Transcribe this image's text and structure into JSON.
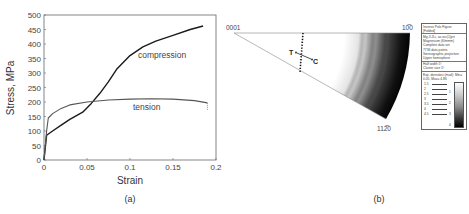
{
  "panels": {
    "a": {
      "label": "(a)"
    },
    "b": {
      "label": "(b)"
    }
  },
  "chart_data": [
    {
      "type": "line",
      "panel": "(a)",
      "title": "",
      "xlabel": "Strain",
      "ylabel": "Stress, MPa",
      "xlim": [
        0,
        0.2
      ],
      "ylim": [
        0,
        500
      ],
      "x_ticks": [
        "0",
        "0.05",
        "0.1",
        "0.15",
        "0.2"
      ],
      "y_ticks": [
        "0",
        "50",
        "100",
        "150",
        "200",
        "250",
        "300",
        "350",
        "400",
        "450",
        "500"
      ],
      "grid": false,
      "legend": "inline annotations",
      "series": [
        {
          "name": "compression",
          "x": [
            0,
            0.003,
            0.01,
            0.02,
            0.03,
            0.045,
            0.055,
            0.065,
            0.075,
            0.085,
            0.1,
            0.115,
            0.13,
            0.15,
            0.17,
            0.185
          ],
          "y": [
            0,
            85,
            100,
            120,
            140,
            165,
            195,
            230,
            270,
            315,
            360,
            390,
            410,
            430,
            450,
            462
          ]
        },
        {
          "name": "tension",
          "x": [
            0,
            0.003,
            0.005,
            0.01,
            0.02,
            0.03,
            0.05,
            0.075,
            0.1,
            0.125,
            0.15,
            0.175,
            0.19
          ],
          "y": [
            0,
            100,
            145,
            160,
            178,
            190,
            200,
            207,
            210,
            211,
            210,
            205,
            197
          ]
        }
      ],
      "annotations": [
        "compression",
        "tension"
      ]
    },
    {
      "type": "heatmap",
      "panel": "(b)",
      "title": "Inverse Pole Figure (Folded)",
      "corner_labels": {
        "apex": "0001",
        "top_right": "10̅0",
        "bottom_right": "112̅0"
      },
      "arrow_labels": {
        "tension": "T",
        "compression": "C"
      },
      "description": "Intensity increases toward the 10-10 / 11-20 edge (dark), white near 0001",
      "legend": {
        "header": [
          "Inverse Pole Figure",
          "[Folded]"
        ],
        "info": [
          "Mg-3.2Li, as-rec(1)prt",
          "Magnesium (6/mmm)",
          "Complete data set",
          "7736 data points",
          "Stereographic projection",
          "Upper hemisphere"
        ],
        "params": [
          "Half width 5°",
          "Cluster size 5°"
        ],
        "density": "Exp. densities (mud): Min= 0.05, Max= 4.86",
        "levels": [
          "1.5",
          "2",
          "2.5",
          "3",
          "3.5",
          "4",
          "4.5"
        ],
        "scale_ticks": [
          "1",
          "2",
          "3",
          "4"
        ]
      }
    }
  ]
}
